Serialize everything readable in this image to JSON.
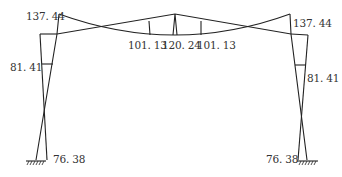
{
  "diagram": {
    "line_color": "#222222",
    "label_color": "#333333",
    "labels": {
      "left_top": "137. 44",
      "right_top": "137. 44",
      "left_mid": "81. 41",
      "right_mid": "81. 41",
      "left_base": "76. 38",
      "right_base": "76. 38",
      "beam_left": "101. 13",
      "beam_center": "120. 24",
      "beam_right": "101. 13"
    },
    "supports": [
      "fixed-support-left",
      "fixed-support-right"
    ]
  }
}
